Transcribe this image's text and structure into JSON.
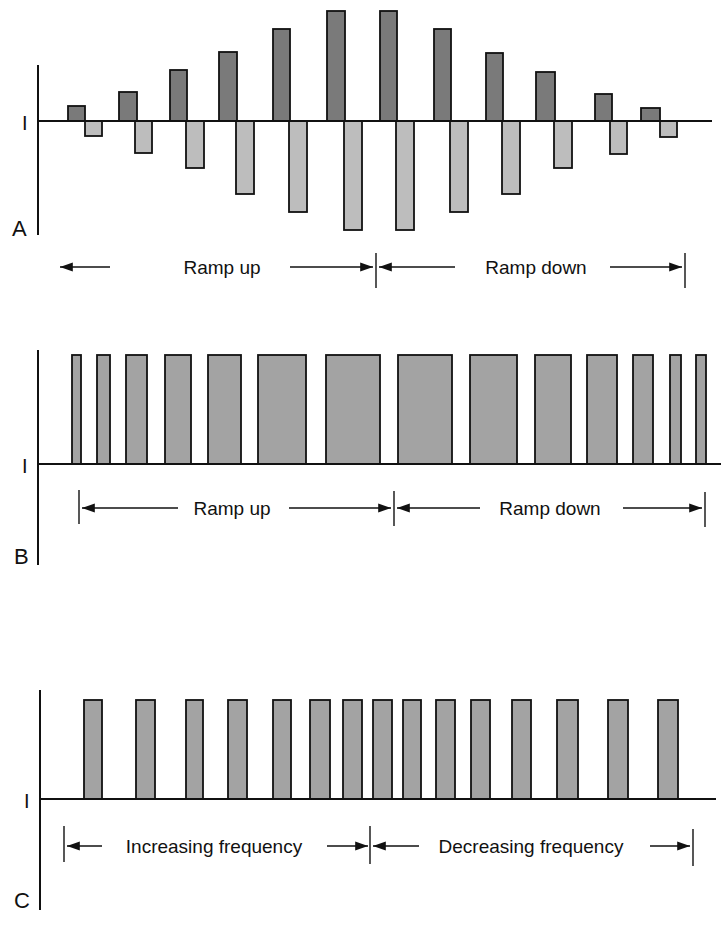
{
  "figure": {
    "colors": {
      "line": "#111111",
      "dark_bar": "#7a7a7a",
      "light_bar": "#bdbdbd",
      "medium_bar": "#a3a3a3",
      "background": "#ffffff"
    }
  },
  "chart_data": [
    {
      "panel": "A",
      "type": "bar",
      "ylabel": "I",
      "description": "Alternating positive/negative current pulses with ramp up then ramp down in amplitude",
      "baseline_y": 121,
      "pulses": [
        {
          "up": {
            "x": 68,
            "w": 17,
            "top": 106
          },
          "down": {
            "x": 85,
            "w": 17,
            "bottom": 136
          }
        },
        {
          "up": {
            "x": 119,
            "w": 18,
            "top": 92
          },
          "down": {
            "x": 135,
            "w": 17,
            "bottom": 153
          }
        },
        {
          "up": {
            "x": 170,
            "w": 17,
            "top": 70
          },
          "down": {
            "x": 186,
            "w": 18,
            "bottom": 168
          }
        },
        {
          "up": {
            "x": 219,
            "w": 18,
            "top": 52
          },
          "down": {
            "x": 236,
            "w": 18,
            "bottom": 194
          }
        },
        {
          "up": {
            "x": 273,
            "w": 17,
            "top": 29
          },
          "down": {
            "x": 289,
            "w": 18,
            "bottom": 212
          }
        },
        {
          "up": {
            "x": 327,
            "w": 18,
            "top": 11
          },
          "down": {
            "x": 344,
            "w": 18,
            "bottom": 230
          }
        },
        {
          "up": {
            "x": 380,
            "w": 17,
            "top": 11
          },
          "down": {
            "x": 396,
            "w": 18,
            "bottom": 230
          }
        },
        {
          "up": {
            "x": 434,
            "w": 17,
            "top": 29
          },
          "down": {
            "x": 450,
            "w": 18,
            "bottom": 212
          }
        },
        {
          "up": {
            "x": 486,
            "w": 17,
            "top": 53
          },
          "down": {
            "x": 502,
            "w": 18,
            "bottom": 194
          }
        },
        {
          "up": {
            "x": 536,
            "w": 19,
            "top": 72
          },
          "down": {
            "x": 554,
            "w": 18,
            "bottom": 168
          }
        },
        {
          "up": {
            "x": 595,
            "w": 17,
            "top": 94
          },
          "down": {
            "x": 610,
            "w": 17,
            "bottom": 154
          }
        },
        {
          "up": {
            "x": 641,
            "w": 19,
            "top": 108
          },
          "down": {
            "x": 660,
            "w": 17,
            "bottom": 137
          }
        }
      ],
      "relative_amplitudes": [
        1,
        2,
        3.5,
        4.8,
        6.4,
        7.6,
        7.6,
        6.4,
        4.7,
        3.4,
        1.9,
        0.9
      ],
      "annotations": {
        "left_label": "Ramp up",
        "right_label": "Ramp down"
      }
    },
    {
      "panel": "B",
      "type": "bar",
      "ylabel": "I",
      "description": "Constant-amplitude unipolar pulses with increasing then decreasing pulse width",
      "baseline_y": 464,
      "top_y": 355,
      "bars": [
        {
          "x": 72,
          "w": 9
        },
        {
          "x": 97,
          "w": 13
        },
        {
          "x": 126,
          "w": 21
        },
        {
          "x": 165,
          "w": 26
        },
        {
          "x": 208,
          "w": 33
        },
        {
          "x": 258,
          "w": 48
        },
        {
          "x": 326,
          "w": 54
        },
        {
          "x": 398,
          "w": 54
        },
        {
          "x": 470,
          "w": 47
        },
        {
          "x": 535,
          "w": 36
        },
        {
          "x": 587,
          "w": 30
        },
        {
          "x": 633,
          "w": 20
        },
        {
          "x": 670,
          "w": 11
        },
        {
          "x": 696,
          "w": 10
        }
      ],
      "pulse_widths_px": [
        9,
        13,
        21,
        26,
        33,
        48,
        54,
        54,
        47,
        36,
        30,
        20,
        11,
        10
      ],
      "annotations": {
        "left_label": "Ramp up",
        "right_label": "Ramp down"
      }
    },
    {
      "panel": "C",
      "type": "bar",
      "ylabel": "I",
      "description": "Constant-amplitude, constant-width pulses with increasing then decreasing frequency",
      "baseline_y": 799,
      "top_y": 700,
      "bars": [
        {
          "x": 84,
          "w": 18
        },
        {
          "x": 136,
          "w": 19
        },
        {
          "x": 186,
          "w": 17
        },
        {
          "x": 228,
          "w": 19
        },
        {
          "x": 273,
          "w": 18
        },
        {
          "x": 310,
          "w": 20
        },
        {
          "x": 343,
          "w": 19
        },
        {
          "x": 373,
          "w": 19
        },
        {
          "x": 403,
          "w": 18
        },
        {
          "x": 436,
          "w": 19
        },
        {
          "x": 471,
          "w": 19
        },
        {
          "x": 512,
          "w": 19
        },
        {
          "x": 557,
          "w": 21
        },
        {
          "x": 608,
          "w": 20
        },
        {
          "x": 658,
          "w": 20
        }
      ],
      "annotations": {
        "left_label": "Increasing frequency",
        "right_label": "Decreasing frequency"
      }
    }
  ],
  "panels": {
    "A": {
      "letter": "A",
      "axis_label": "I",
      "arrow_left_label": "Ramp up",
      "arrow_right_label": "Ramp down"
    },
    "B": {
      "letter": "B",
      "axis_label": "I",
      "arrow_left_label": "Ramp up",
      "arrow_right_label": "Ramp down"
    },
    "C": {
      "letter": "C",
      "axis_label": "I",
      "arrow_left_label": "Increasing frequency",
      "arrow_right_label": "Decreasing frequency"
    }
  }
}
